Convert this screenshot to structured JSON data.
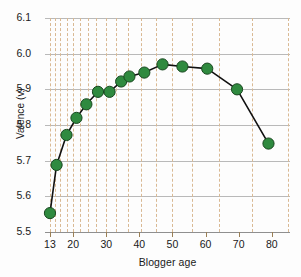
{
  "chart_data": {
    "type": "line",
    "title": "",
    "subtitle": "",
    "xlabel": "Blogger age",
    "ylabel": "Valence (v)",
    "xlim": [
      11.5,
      85.5
    ],
    "ylim": [
      5.5,
      6.1
    ],
    "grid": true,
    "legend": null,
    "marker": "circle",
    "marker_color": "#2f8a3f",
    "marker_edge_color": "#18471f",
    "line_color": "#111111",
    "x_tick_labels": [
      "13",
      "20",
      "30",
      "40",
      "50",
      "60",
      "70",
      "80"
    ],
    "x_ticks": [
      13,
      20,
      30,
      40,
      50,
      60,
      70,
      80
    ],
    "y_tick_labels": [
      "5.5",
      "5.6",
      "5.7",
      "5.8",
      "5.9",
      "6.0",
      "6.1"
    ],
    "y_ticks": [
      5.5,
      5.6,
      5.7,
      5.8,
      5.9,
      6.0,
      6.1
    ],
    "vertical_gridlines_x": [
      13,
      14.5,
      16,
      18,
      20,
      22,
      24.5,
      27,
      30,
      33,
      36.5,
      40.5,
      45,
      50,
      56,
      64,
      74,
      85
    ],
    "x": [
      13,
      15,
      18,
      21,
      24,
      27.5,
      31,
      34.5,
      37,
      41.5,
      47,
      53,
      60.5,
      69.5,
      79
    ],
    "y": [
      5.553,
      5.688,
      5.772,
      5.82,
      5.858,
      5.893,
      5.893,
      5.922,
      5.936,
      5.947,
      5.97,
      5.964,
      5.958,
      5.9,
      5.748
    ],
    "series": [
      {
        "name": "Valence by blogger age",
        "points": [
          {
            "age": 13,
            "valence": 5.553
          },
          {
            "age": 15,
            "valence": 5.688
          },
          {
            "age": 18,
            "valence": 5.772
          },
          {
            "age": 21,
            "valence": 5.82
          },
          {
            "age": 24,
            "valence": 5.858
          },
          {
            "age": 27.5,
            "valence": 5.893
          },
          {
            "age": 31,
            "valence": 5.893
          },
          {
            "age": 34.5,
            "valence": 5.922
          },
          {
            "age": 37,
            "valence": 5.936
          },
          {
            "age": 41.5,
            "valence": 5.947
          },
          {
            "age": 47,
            "valence": 5.97
          },
          {
            "age": 53,
            "valence": 5.964
          },
          {
            "age": 60.5,
            "valence": 5.958
          },
          {
            "age": 69.5,
            "valence": 5.9
          },
          {
            "age": 79,
            "valence": 5.748
          }
        ]
      }
    ]
  },
  "colors": {
    "marker_fill": "#2f8a3f",
    "marker_edge": "#18471f",
    "line": "#111111",
    "hgrid": "#b9b9b9",
    "vgrid": "#d9b993",
    "text": "#1a1a1a",
    "background": "#fdfdfd"
  }
}
